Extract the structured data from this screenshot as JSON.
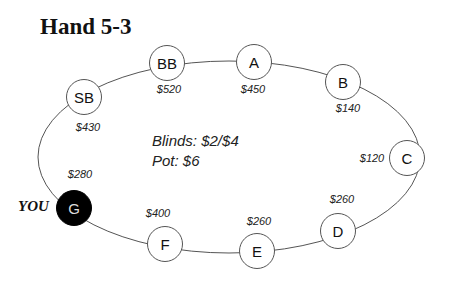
{
  "title": "Hand 5-3",
  "hero_label": "YOU",
  "table_info": {
    "blinds": "Blinds: $2/$4",
    "pot": "Pot: $6"
  },
  "colors": {
    "hero_seat_fill": "#000000",
    "seat_fill": "#ffffff",
    "table_line": "#555555"
  },
  "seats": [
    {
      "position": "SB",
      "stack": "$430",
      "is_hero": false
    },
    {
      "position": "BB",
      "stack": "$520",
      "is_hero": false
    },
    {
      "position": "A",
      "stack": "$450",
      "is_hero": false
    },
    {
      "position": "B",
      "stack": "$140",
      "is_hero": false
    },
    {
      "position": "C",
      "stack": "$120",
      "is_hero": false
    },
    {
      "position": "D",
      "stack": "$260",
      "is_hero": false
    },
    {
      "position": "E",
      "stack": "$260",
      "is_hero": false
    },
    {
      "position": "F",
      "stack": "$400",
      "is_hero": false
    },
    {
      "position": "G",
      "stack": "$280",
      "is_hero": true
    }
  ]
}
